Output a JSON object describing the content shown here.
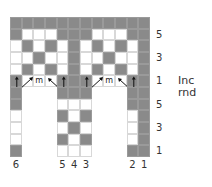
{
  "chart_data": {
    "type": "table",
    "colors": {
      "dark": "#8a8a8a",
      "light": "#ffffff"
    },
    "legend_note": "D = dark (contrast color), W = white (main color), m = make one, arrows = increase direction",
    "columns": 12,
    "rows": [
      {
        "row": 1,
        "cells": [
          "D",
          "D",
          "D",
          "D",
          "D",
          "D",
          "D",
          "D",
          "D",
          "D",
          "D",
          "D"
        ]
      },
      {
        "row": 2,
        "cells": [
          "D",
          "W",
          "W",
          "W",
          "D",
          "D",
          "D",
          "W",
          "W",
          "W",
          "D",
          "D"
        ],
        "label": "5"
      },
      {
        "row": 3,
        "cells": [
          "W",
          "D",
          "W",
          "D",
          "W",
          "D",
          "W",
          "D",
          "W",
          "D",
          "W",
          "D"
        ]
      },
      {
        "row": 4,
        "cells": [
          "W",
          "W",
          "D",
          "W",
          "W",
          "D",
          "W",
          "W",
          "D",
          "W",
          "W",
          "D"
        ],
        "label": "3"
      },
      {
        "row": 5,
        "cells": [
          "W",
          "D",
          "W",
          "D",
          "W",
          "D",
          "W",
          "D",
          "W",
          "D",
          "W",
          "D"
        ]
      },
      {
        "row": 6,
        "cells": [
          "D",
          "W",
          "W",
          "W",
          "D",
          "D",
          "D",
          "W",
          "W",
          "W",
          "D",
          "D"
        ],
        "label": "1",
        "note": "Inc rnd",
        "symbols": [
          "up",
          "up-right",
          "m",
          "up-left",
          "up",
          "",
          "up",
          "up-right",
          "m",
          "up-left",
          "up",
          ""
        ]
      },
      {
        "row": 7,
        "cells": [
          "D",
          "",
          "",
          "",
          "D",
          "D",
          "D",
          "",
          "",
          "",
          "D",
          "D"
        ]
      },
      {
        "row": 8,
        "cells": [
          "D",
          "",
          "",
          "",
          "W",
          "W",
          "W",
          "",
          "",
          "",
          "D",
          "D"
        ],
        "label": "5"
      },
      {
        "row": 9,
        "cells": [
          "W",
          "",
          "",
          "",
          "D",
          "W",
          "D",
          "",
          "",
          "",
          "W",
          "D"
        ]
      },
      {
        "row": 10,
        "cells": [
          "W",
          "",
          "",
          "",
          "W",
          "D",
          "W",
          "",
          "",
          "",
          "W",
          "D"
        ],
        "label": "3"
      },
      {
        "row": 11,
        "cells": [
          "W",
          "",
          "",
          "",
          "D",
          "W",
          "D",
          "",
          "",
          "",
          "W",
          "D"
        ]
      },
      {
        "row": 12,
        "cells": [
          "D",
          "",
          "",
          "",
          "W",
          "W",
          "W",
          "",
          "",
          "",
          "D",
          "D"
        ],
        "label": "1"
      }
    ],
    "bottom_labels": [
      {
        "col": 1,
        "text": "6"
      },
      {
        "col": 5,
        "text": "5"
      },
      {
        "col": 6,
        "text": "4"
      },
      {
        "col": 7,
        "text": "3"
      },
      {
        "col": 11,
        "text": "2"
      },
      {
        "col": 12,
        "text": "1"
      }
    ]
  },
  "labels": {
    "right": [
      {
        "row": 2,
        "text": "5"
      },
      {
        "row": 4,
        "text": "3"
      },
      {
        "row": 6,
        "text": "1"
      },
      {
        "row": 8,
        "text": "5"
      },
      {
        "row": 10,
        "text": "3"
      },
      {
        "row": 12,
        "text": "1"
      }
    ],
    "inc_rnd": "Inc rnd",
    "m_symbol": "m"
  }
}
